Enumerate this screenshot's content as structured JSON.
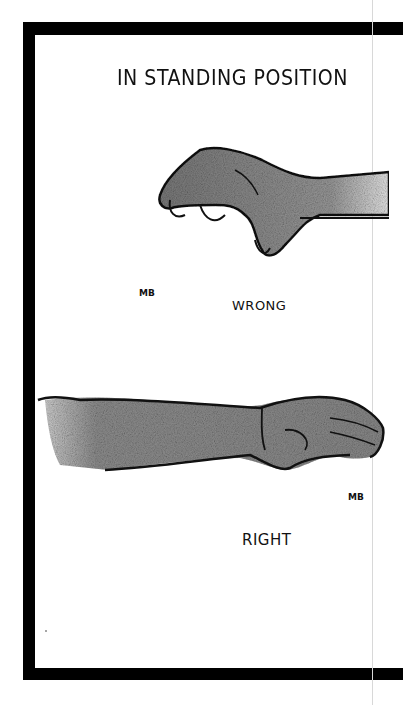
{
  "page": {
    "title": "IN STANDING POSITION",
    "panels": [
      {
        "label": "WRONG",
        "illustration": "hand-bent-wrist-drooping"
      },
      {
        "label": "RIGHT",
        "illustration": "hand-straight-wrist-level"
      }
    ],
    "signature": "MB"
  },
  "colors": {
    "ink": "#111111",
    "frame": "#000000",
    "shading": "#8a8a8a",
    "paper": "#ffffff"
  }
}
